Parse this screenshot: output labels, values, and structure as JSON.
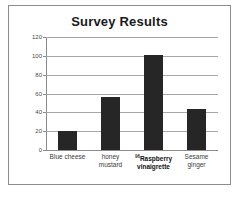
{
  "chart_data": {
    "type": "bar",
    "title": "Survey Results",
    "xlabel": "",
    "ylabel": "",
    "ylim": [
      0,
      120
    ],
    "yticks": [
      0,
      20,
      40,
      60,
      80,
      100,
      120
    ],
    "grid": true,
    "legend": false,
    "categories": [
      "Blue cheese",
      "honey mustard",
      "Raspberry vinaigrette",
      "Sesame ginger"
    ],
    "category_lines": [
      [
        "Blue cheese"
      ],
      [
        "honey",
        "mustard"
      ],
      [
        "Raspberry",
        "vinaigrette"
      ],
      [
        "Sesame",
        "ginger"
      ]
    ],
    "values": [
      20,
      56,
      101,
      44
    ],
    "annotations": [
      {
        "category": "Raspberry vinaigrette",
        "marker": "96",
        "emphasis": "bold"
      }
    ],
    "colors": {
      "bar": "#262626",
      "gridline": "#a6a6a6",
      "axis": "#8a8a8a",
      "title": "#1a1a1a",
      "tick_label": "#4a4a4a",
      "frame": "#8d8d8d",
      "background": "#ffffff"
    }
  }
}
